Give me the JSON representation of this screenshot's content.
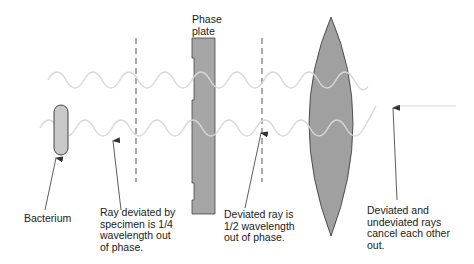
{
  "labels": {
    "phase_plate": "Phase\nplate",
    "bacterium": "Bacterium",
    "ray_deviated": "Ray deviated by\nspecimen is 1/4\nwavelength out\nof phase.",
    "deviated_half": "Deviated ray is\n1/2 wavelength\nout of phase.",
    "cancel": "Deviated and\nundeviated rays\ncancel each other\nout."
  },
  "colors": {
    "wave": "#d8d8d8",
    "wave_on_gray": "#e8e8e8",
    "plate_fill": "#a6a6a6",
    "lens_fill": "#a0a0a0",
    "bacterium_fill": "#c8c8c8",
    "outline": "#333333",
    "arrow": "#333333"
  }
}
